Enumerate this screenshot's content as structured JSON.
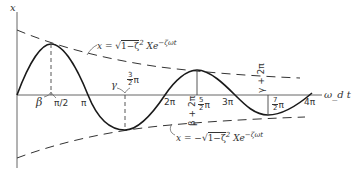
{
  "diagram": {
    "type": "damped-oscillation",
    "y_axis_label": "x",
    "x_axis_label": "ω_d t",
    "upper_envelope_label": "x = √(1−ζ²) Xe^(−ζωt)",
    "upper_envelope_prefix": "x = √",
    "upper_envelope_radicand": "1−ζ",
    "upper_envelope_exp": "2",
    "upper_envelope_suffix": "Xe",
    "upper_envelope_power": "−ζωt",
    "lower_envelope_label": "x = −√(1−ζ²) Xe^(−ζωt)",
    "lower_envelope_prefix": "x = −√",
    "lower_envelope_radicand": "1−ζ",
    "lower_envelope_exp": "2",
    "lower_envelope_suffix": "Xe",
    "lower_envelope_power": "−ζωt",
    "tick_labels": {
      "beta": "β",
      "pi_over_2": "π/2",
      "pi": "π",
      "gamma": "γ",
      "three_halves_pi_num": "3",
      "three_halves_pi_den": "2",
      "three_halves_pi_sym": "π",
      "two_pi": "2π",
      "beta_plus_2pi": "β + 2π",
      "five_halves_pi_num": "5",
      "five_halves_pi_den": "2",
      "five_halves_pi_sym": "π",
      "three_pi": "3π",
      "gamma_plus_2pi": "γ + 2π",
      "seven_halves_pi_num": "7",
      "seven_halves_pi_den": "2",
      "seven_halves_pi_sym": "π",
      "four_pi": "4π"
    },
    "colors": {
      "curve": "#1a1a1a",
      "axis": "#555555",
      "envelope": "#333333"
    }
  }
}
